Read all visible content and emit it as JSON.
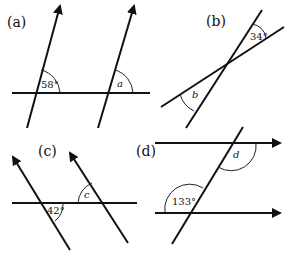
{
  "diagram": {
    "panels": [
      {
        "id": "a",
        "label": "(a)",
        "given_angle": "58°",
        "unknown": "a"
      },
      {
        "id": "b",
        "label": "(b)",
        "given_angle": "34°",
        "unknown": "b"
      },
      {
        "id": "c",
        "label": "(c)",
        "given_angle": "42°",
        "unknown": "c"
      },
      {
        "id": "d",
        "label": "(d)",
        "given_angle": "133°",
        "unknown": "d"
      }
    ],
    "colors": {
      "line": "#111111",
      "background": "#ffffff"
    }
  }
}
